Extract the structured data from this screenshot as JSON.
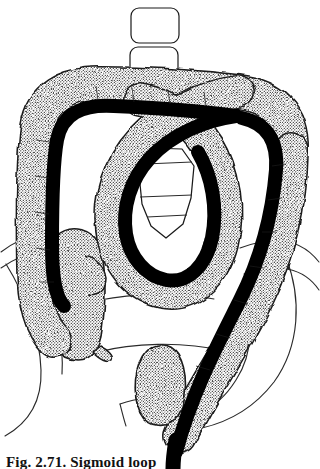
{
  "figure": {
    "kind": "medical-line-illustration",
    "title_visible": false,
    "caption": "Fig. 2.71. Sigmoid loop",
    "caption_clipped": true,
    "background_color": "#ffffff",
    "ink_color": "#000000",
    "outline_color": "#1a1a1a",
    "stipple_dot_color": "#000000",
    "stipple_background": "#ffffff",
    "stipple_apparent_gray": "#d8d8d8"
  },
  "legend_note": {
    "bowel_label": "colon (stippled wall)",
    "scope_label": "endoscope (solid black)",
    "bone_label": "vertebrae and pelvis (thin outline)"
  },
  "parts": [
    {
      "id": "vertebra-upper",
      "label": "lumbar vertebral body (upper)",
      "fill": "#ffffff",
      "stroke": "#1a1a1a"
    },
    {
      "id": "vertebra-lower",
      "label": "lumbar vertebral body (lower)",
      "fill": "#ffffff",
      "stroke": "#1a1a1a"
    },
    {
      "id": "sacrum",
      "label": "sacrum",
      "fill": "#ffffff",
      "stroke": "#1a1a1a"
    },
    {
      "id": "pelvis-left",
      "label": "left iliac bone outline",
      "fill": "none",
      "stroke": "#1a1a1a"
    },
    {
      "id": "pelvis-right",
      "label": "right iliac bone outline",
      "fill": "none",
      "stroke": "#1a1a1a"
    },
    {
      "id": "colon-wall",
      "label": "colon wall",
      "fill": "stipple",
      "stroke": "#1a1a1a"
    },
    {
      "id": "endoscope",
      "label": "endoscope shaft",
      "fill": "#000000",
      "stroke": "#000000"
    },
    {
      "id": "cecum",
      "label": "cecum",
      "fill": "stipple",
      "stroke": "#1a1a1a"
    },
    {
      "id": "appendix",
      "label": "appendix",
      "fill": "stipple",
      "stroke": "#1a1a1a"
    },
    {
      "id": "rectum",
      "label": "rectum",
      "fill": "stipple",
      "stroke": "#1a1a1a"
    }
  ],
  "geometry": {
    "viewbox": "0 0 320 469",
    "vertebra_upper": {
      "x": 131,
      "y": 8,
      "w": 48,
      "h": 35,
      "r": 7
    },
    "vertebra_lower": {
      "x": 130,
      "y": 47,
      "w": 48,
      "h": 35,
      "r": 7
    },
    "sacrum_path": "M151 150 L181 150 L192 166 L190 196 L183 222 L167 236 L152 226 L143 205 L140 175 Z",
    "sacrum_lines": [
      "M146 163 L190 161",
      "M141 196 L191 194",
      "M146 216 L186 214"
    ],
    "abdomen_outline": [
      "M2 250 C 22 236, 46 230, 70 236",
      "M2 262 C 26 246, 58 240, 82 250",
      "M98 300 C 126 296, 172 294, 210 300",
      "M96 352 C 130 344, 180 342, 222 350",
      "M236 250 C 272 238, 300 242, 318 262",
      "M240 272 C 276 262, 302 268, 318 288"
    ],
    "pelvis_left_path": "M8 268 C 28 300, 40 338, 40 372 C 40 400, 28 420, 6 432",
    "pelvis_right_path": "M286 262 C 300 300, 300 344, 276 380 C 258 406, 232 420, 206 426",
    "pelvis_right_inner": "M236 296 C 250 320, 250 352, 234 378",
    "colon_outer_path": "M 96 330 C 60 330, 38 312, 36 270 C 34 206, 34 150, 36 122 C 38 96, 58 82, 92 82 C 140 82, 196 84, 232 86 C 268 88, 288 104, 288 140 C 288 190, 282 246, 262 292 C 240 342, 206 392, 180 430",
    "scope_path": "M 64 300 C 48 296, 46 276, 46 250 C 46 206, 46 164, 50 140 C 54 112, 74 102, 108 104 C 152 106, 206 108, 240 112 C 268 116, 276 132, 274 158 C 270 214, 256 262, 236 300 C 214 342, 190 390, 172 452"
  },
  "caption_style": {
    "font_weight": "bold",
    "font_size_px": 15,
    "color": "#111111"
  }
}
